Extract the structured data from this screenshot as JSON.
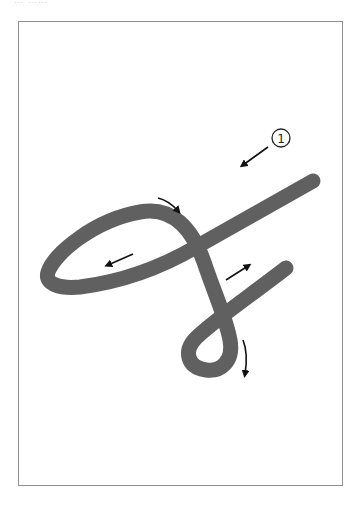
{
  "caption": "… ……",
  "diagram": {
    "type": "stroke-order",
    "stroke_color": "#606060",
    "arrow_color": "#111111",
    "frame_color": "#8f8f8f",
    "step_label": "①"
  }
}
